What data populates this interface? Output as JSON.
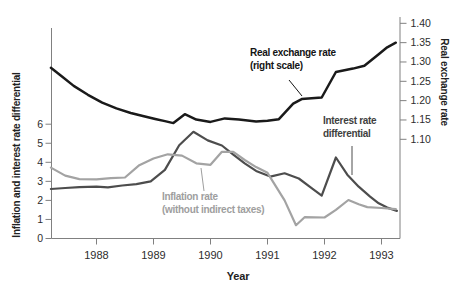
{
  "figure": {
    "x_axis_title": "Year",
    "left_axis_title": "Inflation and interest rate differential",
    "right_axis_title": "Real exchange rate"
  },
  "annotations": {
    "real_exchange": {
      "line1": "Real exchange rate",
      "line2": "(right scale)"
    },
    "interest": {
      "line1": "Interest rate",
      "line2": "differential"
    },
    "inflation": {
      "line1": "Inflation rate",
      "line2": "(without indirect taxes)"
    }
  },
  "colors": {
    "real_exchange_line": "#1a1a1a",
    "interest_line": "#4d4d4d",
    "inflation_line": "#a3a3a3",
    "axis": "#808080",
    "tick_text": "#2d2d2d"
  },
  "chart_data": {
    "type": "line",
    "x_label": "Year",
    "left_y_label": "Inflation and interest rate differential",
    "right_y_label": "Real exchange rate",
    "grid": false,
    "legend_position": "inline-annotations",
    "x_ticks": [
      1988,
      1989,
      1990,
      1991,
      1992,
      1993
    ],
    "left_y_ticks": [
      0,
      1,
      2,
      3,
      4,
      5,
      6
    ],
    "right_y_ticks": [
      "1.10",
      "1.15",
      "1.20",
      "1.25",
      "1.30",
      "1.35",
      "1.40"
    ],
    "x_range": [
      1987.2,
      1993.3
    ],
    "left_y_range": [
      0,
      6.6
    ],
    "right_y_range": [
      1.095,
      1.405
    ],
    "series": [
      {
        "name": "Real exchange rate (right scale)",
        "axis": "right",
        "color": "#1a1a1a",
        "width": 2.5,
        "points": [
          [
            1987.2,
            1.285
          ],
          [
            1987.4,
            1.262
          ],
          [
            1987.6,
            1.238
          ],
          [
            1987.85,
            1.215
          ],
          [
            1988.1,
            1.195
          ],
          [
            1988.35,
            1.18
          ],
          [
            1988.6,
            1.168
          ],
          [
            1988.85,
            1.159
          ],
          [
            1989.05,
            1.152
          ],
          [
            1989.2,
            1.147
          ],
          [
            1989.35,
            1.142
          ],
          [
            1989.55,
            1.165
          ],
          [
            1989.75,
            1.151
          ],
          [
            1990.0,
            1.145
          ],
          [
            1990.25,
            1.154
          ],
          [
            1990.5,
            1.151
          ],
          [
            1990.8,
            1.146
          ],
          [
            1991.0,
            1.148
          ],
          [
            1991.2,
            1.152
          ],
          [
            1991.45,
            1.192
          ],
          [
            1991.6,
            1.204
          ],
          [
            1991.95,
            1.208
          ],
          [
            1992.2,
            1.274
          ],
          [
            1992.5,
            1.283
          ],
          [
            1992.7,
            1.29
          ],
          [
            1992.95,
            1.32
          ],
          [
            1993.1,
            1.338
          ],
          [
            1993.25,
            1.35
          ]
        ]
      },
      {
        "name": "Interest rate differential",
        "axis": "left",
        "color": "#4d4d4d",
        "width": 2.2,
        "points": [
          [
            1987.2,
            2.6
          ],
          [
            1987.45,
            2.65
          ],
          [
            1987.7,
            2.7
          ],
          [
            1988.0,
            2.72
          ],
          [
            1988.2,
            2.68
          ],
          [
            1988.45,
            2.78
          ],
          [
            1988.7,
            2.85
          ],
          [
            1988.95,
            3.0
          ],
          [
            1989.2,
            3.6
          ],
          [
            1989.45,
            4.9
          ],
          [
            1989.7,
            5.6
          ],
          [
            1989.95,
            5.15
          ],
          [
            1990.2,
            4.88
          ],
          [
            1990.4,
            4.4
          ],
          [
            1990.6,
            3.95
          ],
          [
            1990.8,
            3.55
          ],
          [
            1991.05,
            3.25
          ],
          [
            1991.3,
            3.42
          ],
          [
            1991.55,
            3.15
          ],
          [
            1991.75,
            2.7
          ],
          [
            1991.95,
            2.25
          ],
          [
            1992.2,
            4.25
          ],
          [
            1992.4,
            3.35
          ],
          [
            1992.6,
            2.72
          ],
          [
            1992.8,
            2.2
          ],
          [
            1992.95,
            1.85
          ],
          [
            1993.1,
            1.62
          ],
          [
            1993.27,
            1.45
          ]
        ]
      },
      {
        "name": "Inflation rate (without indirect taxes)",
        "axis": "left",
        "color": "#a3a3a3",
        "width": 2.2,
        "points": [
          [
            1987.2,
            3.72
          ],
          [
            1987.45,
            3.3
          ],
          [
            1987.7,
            3.12
          ],
          [
            1988.0,
            3.1
          ],
          [
            1988.25,
            3.17
          ],
          [
            1988.5,
            3.2
          ],
          [
            1988.75,
            3.85
          ],
          [
            1989.0,
            4.2
          ],
          [
            1989.25,
            4.42
          ],
          [
            1989.5,
            4.35
          ],
          [
            1989.75,
            3.95
          ],
          [
            1990.0,
            3.87
          ],
          [
            1990.2,
            4.55
          ],
          [
            1990.4,
            4.55
          ],
          [
            1990.6,
            4.12
          ],
          [
            1990.8,
            3.75
          ],
          [
            1991.0,
            3.45
          ],
          [
            1991.3,
            2.0
          ],
          [
            1991.5,
            0.7
          ],
          [
            1991.65,
            1.12
          ],
          [
            1992.0,
            1.1
          ],
          [
            1992.2,
            1.5
          ],
          [
            1992.42,
            2.02
          ],
          [
            1992.6,
            1.8
          ],
          [
            1992.75,
            1.65
          ],
          [
            1993.0,
            1.6
          ],
          [
            1993.25,
            1.54
          ]
        ]
      }
    ]
  }
}
